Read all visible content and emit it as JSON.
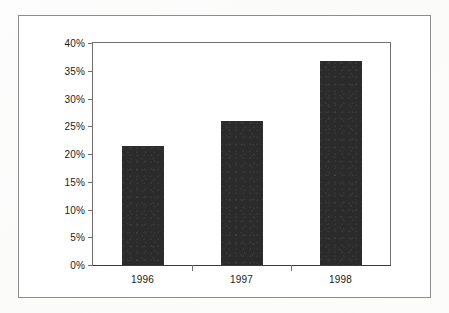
{
  "chart_data": {
    "type": "bar",
    "title": "",
    "subtitle": "",
    "xlabel": "",
    "ylabel": "",
    "categories": [
      "1996",
      "1997",
      "1998"
    ],
    "values": [
      21.4,
      25.9,
      36.8
    ],
    "value_format": "percent",
    "ylim": [
      0,
      40
    ],
    "ytick_step": 5,
    "ytick_labels": [
      "0%",
      "5%",
      "10%",
      "15%",
      "20%",
      "25%",
      "30%",
      "35%",
      "40%"
    ],
    "ytick_values": [
      0,
      5,
      10,
      15,
      20,
      25,
      30,
      35,
      40
    ],
    "grid": false,
    "legend": false,
    "legend_position": "none",
    "series": [
      {
        "name": "",
        "color": "#2b2b2b",
        "values": [
          21.4,
          25.9,
          36.8
        ]
      }
    ],
    "axis_color": "#6f6f6f",
    "baseline_color": "#3a3a3a",
    "plot_background": "#ffffff",
    "frame_color": "#8d8d8d",
    "page_background": "#fdfdfd"
  }
}
